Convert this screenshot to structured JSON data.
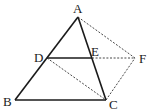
{
  "diagram": {
    "type": "geometry",
    "points": {
      "A": {
        "x": 78,
        "y": 17,
        "label": "A",
        "lx": 73,
        "ly": 13
      },
      "B": {
        "x": 15,
        "y": 100,
        "label": "B",
        "lx": 3,
        "ly": 106
      },
      "C": {
        "x": 106,
        "y": 100,
        "label": "C",
        "lx": 109,
        "ly": 109
      },
      "D": {
        "x": 47,
        "y": 58,
        "label": "D",
        "lx": 34,
        "ly": 62
      },
      "E": {
        "x": 92,
        "y": 58,
        "label": "E",
        "lx": 91,
        "ly": 56
      },
      "F": {
        "x": 135,
        "y": 58,
        "label": "F",
        "lx": 139,
        "ly": 63
      }
    },
    "solid_segments": [
      "AB",
      "AC",
      "BC",
      "DE"
    ],
    "dashed_segments": [
      "AF",
      "EF",
      "DC",
      "CF"
    ]
  }
}
